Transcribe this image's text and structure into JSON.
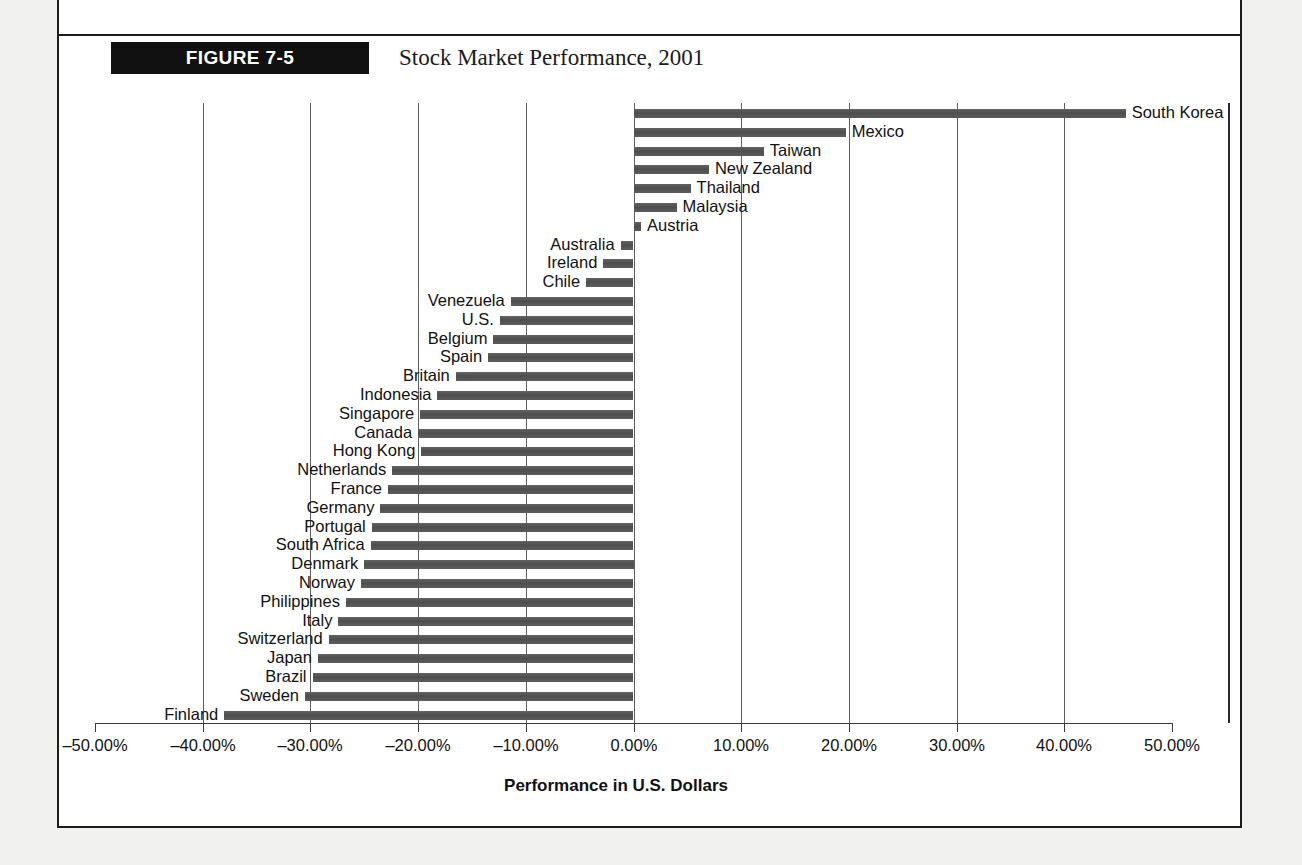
{
  "figure": {
    "tag": "FIGURE 7-5",
    "title": "Stock Market Performance, 2001"
  },
  "chart_data": {
    "type": "bar",
    "orientation": "horizontal",
    "title": "Stock Market Performance, 2001",
    "xlabel": "Performance in U.S. Dollars",
    "ylabel": "",
    "xlim": [
      -50,
      50
    ],
    "xtick_labels": [
      "–50.00%",
      "–40.00%",
      "–30.00%",
      "–20.00%",
      "–10.00%",
      "0.00%",
      "10.00%",
      "20.00%",
      "30.00%",
      "40.00%",
      "50.00%"
    ],
    "xticks": [
      -50,
      -40,
      -30,
      -20,
      -10,
      0,
      10,
      20,
      30,
      40,
      50
    ],
    "grid": true,
    "legend": false,
    "bar_color": "#555555",
    "categories": [
      "South Korea",
      "Mexico",
      "Taiwan",
      "New Zealand",
      "Thailand",
      "Malaysia",
      "Austria",
      "Australia",
      "Ireland",
      "Chile",
      "Venezuela",
      "U.S.",
      "Belgium",
      "Spain",
      "Britain",
      "Indonesia",
      "Singapore",
      "Canada",
      "Hong Kong",
      "Netherlands",
      "France",
      "Germany",
      "Portugal",
      "South Africa",
      "Denmark",
      "Norway",
      "Philippines",
      "Italy",
      "Switzerland",
      "Japan",
      "Brazil",
      "Sweden",
      "Finland"
    ],
    "values": [
      45.7,
      19.7,
      12.1,
      7.0,
      5.3,
      4.0,
      0.7,
      -1.2,
      -2.8,
      -4.4,
      -11.4,
      -12.4,
      -13.0,
      -13.5,
      -16.5,
      -18.2,
      -19.8,
      -20.0,
      -19.7,
      -22.4,
      -22.8,
      -23.5,
      -24.3,
      -24.4,
      -25.0,
      -25.3,
      -26.7,
      -27.4,
      -28.3,
      -29.3,
      -29.8,
      -30.5,
      -38.0
    ]
  }
}
